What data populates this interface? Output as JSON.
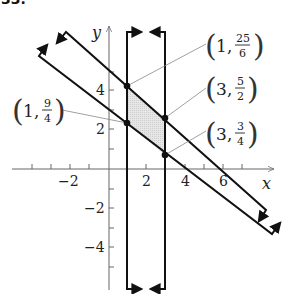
{
  "header": {
    "problem_number": "33."
  },
  "axes": {
    "x_label": "x",
    "y_label": "y",
    "x_ticks": [
      "−2",
      "2",
      "4",
      "6"
    ],
    "y_ticks": [
      "4",
      "2",
      "−2",
      "−4"
    ]
  },
  "lines": [
    {
      "name": "upper-diagonal",
      "equation": "y = -5/6 x + 5"
    },
    {
      "name": "lower-diagonal",
      "equation": "y = -3/4 x + 3"
    },
    {
      "name": "left-vertical",
      "equation": "x = 1"
    },
    {
      "name": "right-vertical",
      "equation": "x = 3"
    }
  ],
  "points": [
    {
      "id": "p1",
      "x": "1",
      "num": "25",
      "den": "6"
    },
    {
      "id": "p2",
      "x": "3",
      "num": "5",
      "den": "2"
    },
    {
      "id": "p3",
      "x": "3",
      "num": "3",
      "den": "4"
    },
    {
      "id": "p4",
      "x": "1",
      "num": "9",
      "den": "4"
    }
  ],
  "colors": {
    "line": "#1a1a1a",
    "axis": "#555555",
    "shade": "#dcdcdc",
    "leader": "#777777"
  }
}
